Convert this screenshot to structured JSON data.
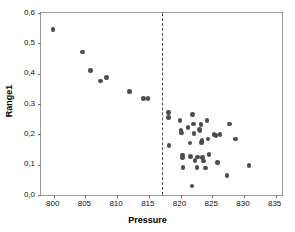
{
  "chart_data": {
    "type": "scatter",
    "title": "",
    "xlabel": "Pressure",
    "ylabel": "Range1",
    "xlim": [
      798,
      836
    ],
    "ylim": [
      0.0,
      0.6
    ],
    "xticks": [
      800,
      805,
      810,
      815,
      820,
      825,
      830,
      835
    ],
    "xticklabels": [
      "800",
      "805",
      "810",
      "815",
      "820",
      "825",
      "830",
      "835"
    ],
    "yticks": [
      0.0,
      0.1,
      0.2,
      0.3,
      0.4,
      0.5,
      0.6
    ],
    "yticklabels": [
      "0,0",
      "0,1",
      "0,2",
      "0,3",
      "0,4",
      "0,5",
      "0,6"
    ],
    "grid": false,
    "legend": false,
    "decimal_separator": ",",
    "marker_color": "#4d4d4d",
    "marker_shape": "circle",
    "frame_color": "#9a9a9a",
    "annotations": [
      {
        "name": "reference-line",
        "type": "vline",
        "x": 817,
        "style": "dashed",
        "color": "#4d4d4d"
      }
    ],
    "series": [
      {
        "name": "Range1",
        "points": [
          [
            799.9,
            0.545
          ],
          [
            804.5,
            0.471
          ],
          [
            805.8,
            0.41
          ],
          [
            807.4,
            0.376
          ],
          [
            808.3,
            0.388
          ],
          [
            812.0,
            0.341
          ],
          [
            814.2,
            0.319
          ],
          [
            814.9,
            0.319
          ],
          [
            818.1,
            0.271
          ],
          [
            818.1,
            0.256
          ],
          [
            818.2,
            0.163
          ],
          [
            819.9,
            0.245
          ],
          [
            820.1,
            0.213
          ],
          [
            820.2,
            0.205
          ],
          [
            820.3,
            0.132
          ],
          [
            820.3,
            0.124
          ],
          [
            820.4,
            0.09
          ],
          [
            821.2,
            0.222
          ],
          [
            821.5,
            0.172
          ],
          [
            821.6,
            0.127
          ],
          [
            821.8,
            0.03
          ],
          [
            821.9,
            0.265
          ],
          [
            822.0,
            0.234
          ],
          [
            822.1,
            0.202
          ],
          [
            822.3,
            0.113
          ],
          [
            822.6,
            0.09
          ],
          [
            822.7,
            0.125
          ],
          [
            823.0,
            0.215
          ],
          [
            823.1,
            0.211
          ],
          [
            823.2,
            0.232
          ],
          [
            823.3,
            0.173
          ],
          [
            823.4,
            0.179
          ],
          [
            823.5,
            0.124
          ],
          [
            823.6,
            0.112
          ],
          [
            823.9,
            0.089
          ],
          [
            824.2,
            0.245
          ],
          [
            824.3,
            0.184
          ],
          [
            824.5,
            0.133
          ],
          [
            825.3,
            0.2
          ],
          [
            825.6,
            0.196
          ],
          [
            825.8,
            0.108
          ],
          [
            826.2,
            0.2
          ],
          [
            827.3,
            0.064
          ],
          [
            827.7,
            0.234
          ],
          [
            828.7,
            0.185
          ],
          [
            830.8,
            0.097
          ]
        ]
      }
    ]
  }
}
